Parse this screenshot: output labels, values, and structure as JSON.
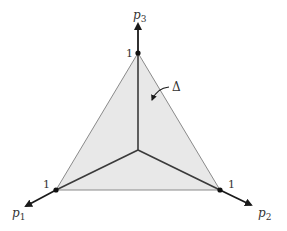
{
  "diagram": {
    "simplex_label": "Δ",
    "axes": [
      {
        "name": "p1",
        "label": "p",
        "subscript": "1",
        "tick": "1"
      },
      {
        "name": "p2",
        "label": "p",
        "subscript": "2",
        "tick": "1"
      },
      {
        "name": "p3",
        "label": "p",
        "subscript": "3",
        "tick": "1"
      }
    ],
    "colors": {
      "fill": "#e6e6e6",
      "edge": "#8a8a8a",
      "axis": "#1a1a1a",
      "inner_lines": "#3a3a3a"
    }
  }
}
